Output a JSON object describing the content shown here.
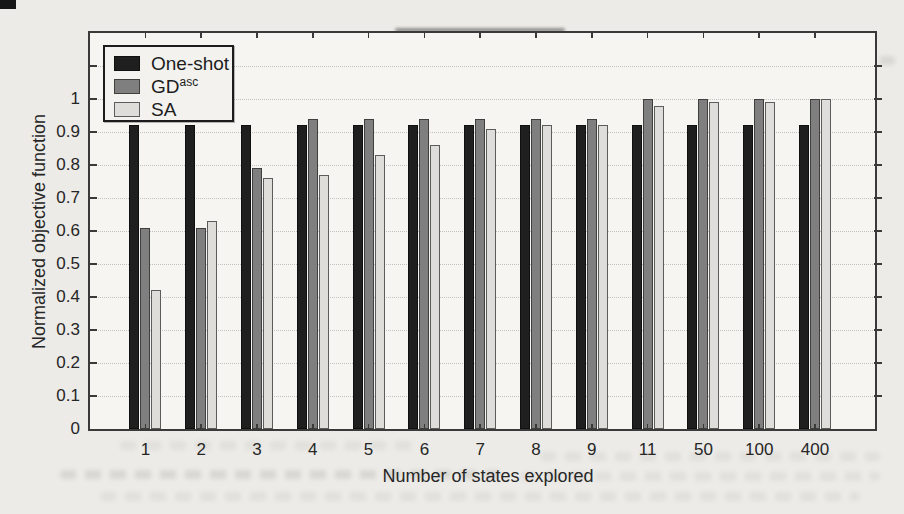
{
  "chart_data": {
    "type": "bar",
    "title": "",
    "xlabel": "Number of states explored",
    "ylabel": "Normalized objective function",
    "categories": [
      "1",
      "2",
      "3",
      "4",
      "5",
      "6",
      "7",
      "8",
      "9",
      "11",
      "50",
      "100",
      "400"
    ],
    "series": [
      {
        "name": "One-shot",
        "label_base": "One-shot",
        "label_sup": "",
        "color": "#1f1f1f",
        "values": [
          0.92,
          0.92,
          0.92,
          0.92,
          0.92,
          0.92,
          0.92,
          0.92,
          0.92,
          0.92,
          0.92,
          0.92,
          0.92
        ]
      },
      {
        "name": "GD^asc",
        "label_base": "GD",
        "label_sup": "asc",
        "color": "#7f7f7f",
        "values": [
          0.61,
          0.61,
          0.79,
          0.94,
          0.94,
          0.94,
          0.94,
          0.94,
          0.94,
          1.0,
          1.0,
          1.0,
          1.0
        ]
      },
      {
        "name": "SA",
        "label_base": "SA",
        "label_sup": "",
        "color": "#dedddа",
        "values": [
          0.42,
          0.63,
          0.76,
          0.77,
          0.83,
          0.86,
          0.91,
          0.92,
          0.92,
          0.98,
          0.99,
          0.99,
          1.0
        ]
      }
    ],
    "ylim": [
      0,
      1.2
    ],
    "yticks": [
      0,
      0.1,
      0.2,
      0.3,
      0.4,
      0.5,
      0.6,
      0.7,
      0.8,
      0.9,
      1
    ],
    "ytick_labels": [
      "0",
      "0.1",
      "0.2",
      "0.3",
      "0.4",
      "0.5",
      "0.6",
      "0.7",
      "0.8",
      "0.9",
      "1"
    ],
    "grid": true,
    "grid_style": "dotted",
    "legend_position": "top-left",
    "background_color": "#f6f5f2",
    "axis_color": "#3a3a3a"
  }
}
